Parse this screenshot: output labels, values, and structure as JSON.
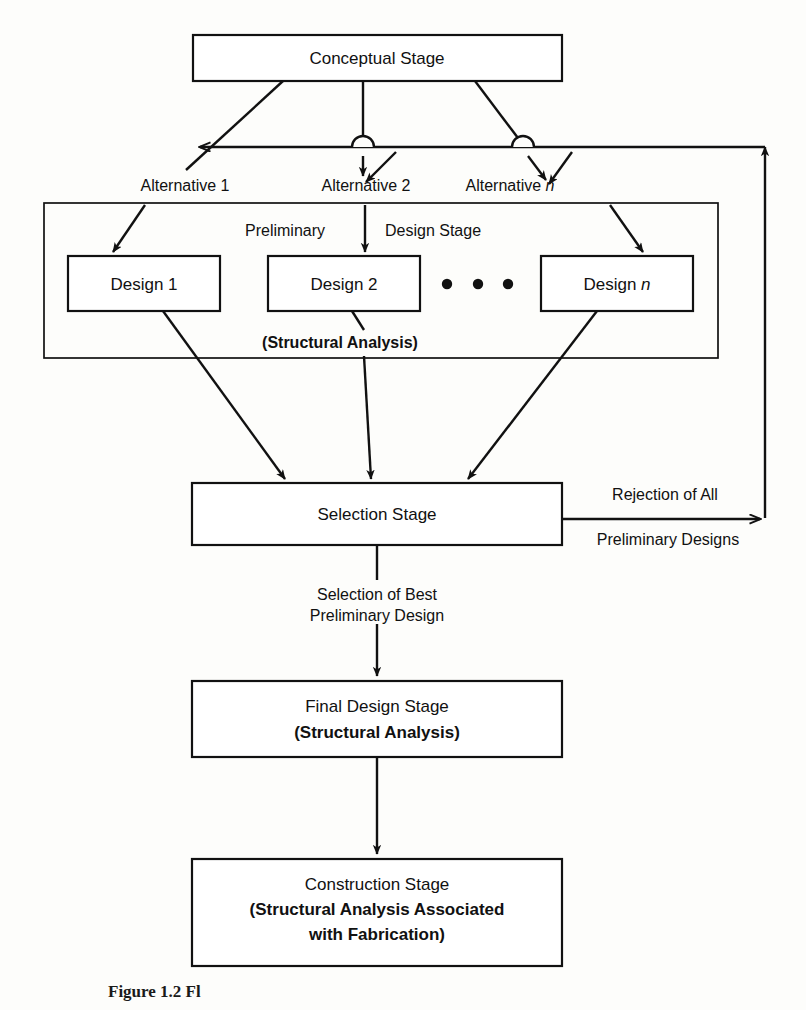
{
  "figure": {
    "domain": "diagram",
    "type": "flowchart",
    "caption": "Figure 1.2  Fl"
  },
  "nodes": {
    "conceptual": {
      "label": "Conceptual Stage"
    },
    "design1": {
      "label": "Design 1"
    },
    "design2": {
      "label": "Design 2"
    },
    "designn": {
      "label": "Design ",
      "suffix": "n"
    },
    "selection": {
      "label": "Selection Stage"
    },
    "final": {
      "line1": "Final Design Stage",
      "line2": "(Structural Analysis)"
    },
    "construction": {
      "line1": "Construction Stage",
      "line2": "(Structural Analysis Associated",
      "line3": "with Fabrication)"
    }
  },
  "groups": {
    "preliminary": {
      "label_left": "Preliminary",
      "label_right": "Design Stage",
      "note": "(Structural Analysis)"
    }
  },
  "edge_labels": {
    "alt1": "Alternative 1",
    "alt2": "Alternative 2",
    "altn_prefix": "Alternative ",
    "altn_suffix": "n",
    "rejection_line1": "Rejection of All",
    "rejection_line2": "Preliminary Designs",
    "selection_line1": "Selection of Best",
    "selection_line2": "Preliminary Design"
  },
  "ellipsis": {
    "dots": 3
  },
  "colors": {
    "ink": "#111111",
    "paper": "#fdfdfb",
    "box_fill": "#ffffff"
  }
}
